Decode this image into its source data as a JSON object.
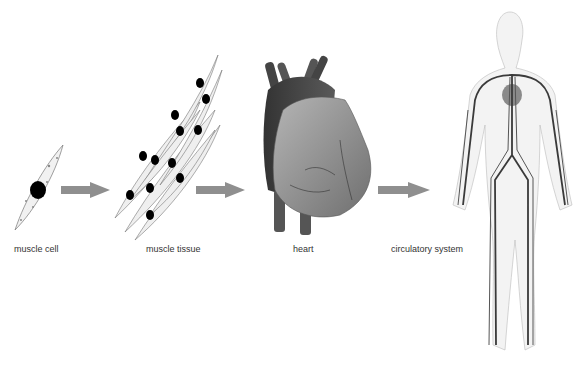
{
  "diagram": {
    "stages": [
      {
        "id": "muscle-cell",
        "label": "muscle cell"
      },
      {
        "id": "muscle-tissue",
        "label": "muscle tissue"
      },
      {
        "id": "heart",
        "label": "heart"
      },
      {
        "id": "circulatory-system",
        "label": "circulatory system"
      }
    ],
    "arrows": [
      "muscle cell → muscle tissue",
      "muscle tissue → heart",
      "heart → circulatory system"
    ],
    "colors": {
      "arrow": "#8f8f8f",
      "outline": "#777777",
      "nucleus": "#000000",
      "vessel": "#3a3a3a",
      "heart_fill": "#9a9a9a"
    }
  }
}
